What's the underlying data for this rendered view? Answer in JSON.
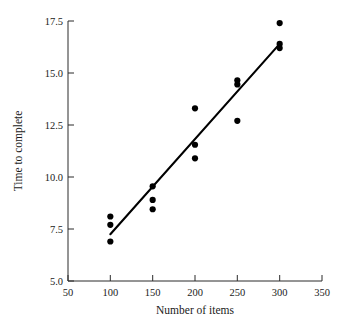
{
  "chart_data": {
    "type": "scatter",
    "title": "",
    "xlabel": "Number of items",
    "ylabel": "Time to complete",
    "xlim": [
      50,
      350
    ],
    "ylim": [
      5.0,
      17.5
    ],
    "grid": false,
    "legend": "none",
    "xticks": [
      50,
      100,
      150,
      200,
      250,
      300,
      350
    ],
    "xtick_labels": [
      "50",
      "100",
      "150",
      "200",
      "250",
      "300",
      "350"
    ],
    "yticks": [
      5.0,
      7.5,
      10.0,
      12.5,
      15.0,
      17.5
    ],
    "ytick_labels": [
      "5.0",
      "7.5",
      "10.0",
      "12.5",
      "15.0",
      "17.5"
    ],
    "point_color": "#000000",
    "line_color": "#000000",
    "x": [
      100,
      100,
      100,
      150,
      150,
      150,
      200,
      200,
      200,
      250,
      250,
      250,
      300,
      300,
      300
    ],
    "y": [
      8.1,
      7.7,
      6.9,
      9.55,
      8.9,
      8.45,
      13.3,
      11.55,
      10.9,
      14.65,
      14.45,
      12.7,
      17.4,
      16.4,
      16.2
    ],
    "points": [
      {
        "x": 100,
        "y": 8.1
      },
      {
        "x": 100,
        "y": 7.7
      },
      {
        "x": 100,
        "y": 6.9
      },
      {
        "x": 150,
        "y": 9.55
      },
      {
        "x": 150,
        "y": 8.9
      },
      {
        "x": 150,
        "y": 8.45
      },
      {
        "x": 200,
        "y": 13.3
      },
      {
        "x": 200,
        "y": 11.55
      },
      {
        "x": 200,
        "y": 10.9
      },
      {
        "x": 250,
        "y": 14.65
      },
      {
        "x": 250,
        "y": 14.45
      },
      {
        "x": 250,
        "y": 12.7
      },
      {
        "x": 300,
        "y": 17.4
      },
      {
        "x": 300,
        "y": 16.4
      },
      {
        "x": 300,
        "y": 16.2
      }
    ],
    "series": [
      {
        "name": "observations",
        "type": "scatter",
        "values": [
          8.1,
          7.7,
          6.9,
          9.55,
          8.9,
          8.45,
          13.3,
          11.55,
          10.9,
          14.65,
          14.45,
          12.7,
          17.4,
          16.4,
          16.2
        ]
      },
      {
        "name": "fitted-line",
        "type": "line",
        "endpoints": [
          {
            "x": 100,
            "y": 7.25
          },
          {
            "x": 300,
            "y": 16.4
          }
        ]
      }
    ],
    "regression_line": {
      "x_start": 100,
      "y_start": 7.25,
      "x_end": 300,
      "y_end": 16.4
    }
  }
}
